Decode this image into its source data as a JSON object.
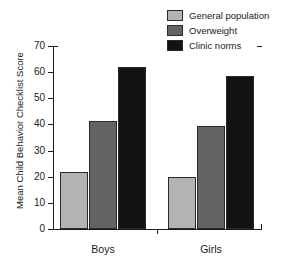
{
  "chart_data": {
    "type": "bar",
    "title": "",
    "xlabel": "",
    "ylabel": "Mean Child Behavior Checklist Score",
    "categories": [
      "Boys",
      "Girls"
    ],
    "ylim": [
      0,
      70
    ],
    "yticks": [
      0,
      10,
      20,
      30,
      40,
      50,
      60,
      70
    ],
    "grid": false,
    "legend_position": "top-right",
    "series": [
      {
        "name": "General population",
        "color": "#b3b3b3",
        "values": [
          22,
          20
        ]
      },
      {
        "name": "Overweight",
        "color": "#636363",
        "values": [
          41.5,
          39.5
        ]
      },
      {
        "name": "Clinic norms",
        "color": "#121212",
        "values": [
          62,
          58.5
        ]
      }
    ]
  }
}
